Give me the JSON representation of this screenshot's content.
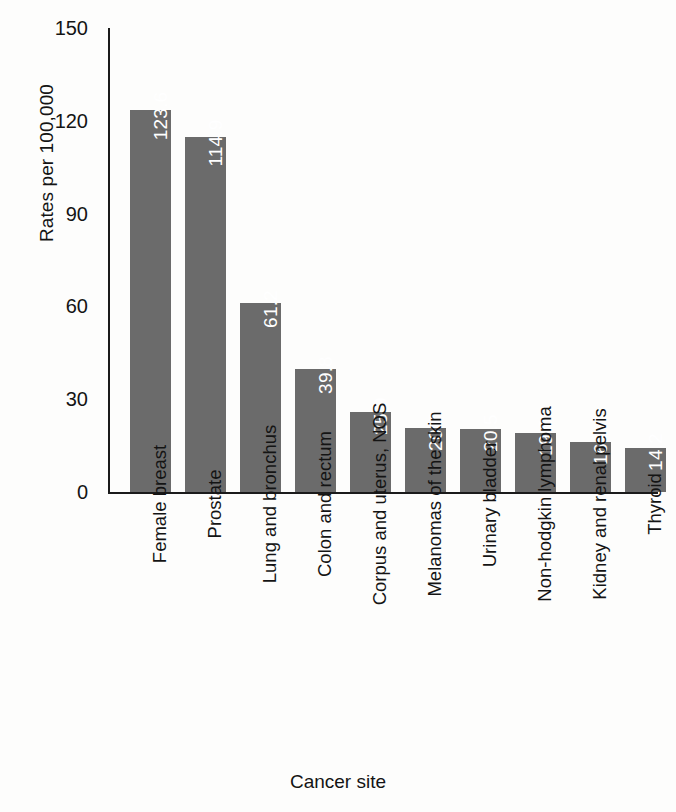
{
  "chart_data": {
    "type": "bar",
    "title": "",
    "xlabel": "Cancer site",
    "ylabel": "Rates per 100,000",
    "categories": [
      "Female breast",
      "Prostate",
      "Lung and bronchus",
      "Colon and rectum",
      "Corpus and uterus, NOS",
      "Melanomas of the skin",
      "Urinary bladder",
      "Non-hodgkin lymphoma",
      "Kidney and renal pelvis",
      "Thyroid"
    ],
    "values": [
      123.6,
      114.9,
      61.2,
      39.8,
      25.9,
      20.7,
      20.5,
      19.0,
      16.1,
      14.2
    ],
    "value_labels": [
      "123.6",
      "114.9",
      "61.2",
      "39.8",
      "25.9",
      "20.7",
      "20.5",
      "19.0",
      "16.1",
      "14.2"
    ],
    "ylim": [
      0,
      150
    ],
    "yticks": [
      0,
      30,
      60,
      90,
      120,
      150
    ],
    "ytick_labels": [
      "0",
      "30",
      "60",
      "90",
      "120",
      "150"
    ],
    "grid": false,
    "legend": false,
    "bar_color": "#6b6b6b",
    "value_label_color": "#ffffff",
    "axis_color": "#1b1b1b",
    "background_color": "#fdfdfc"
  }
}
